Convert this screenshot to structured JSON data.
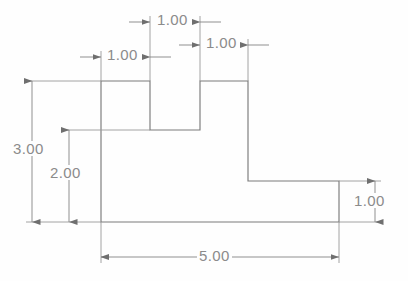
{
  "drawing": {
    "title": "Stepped profile dimensioned drawing",
    "units_per_px": 0.021,
    "colors": {
      "outline": "#7a7a7a",
      "dimension_line": "#8b8b8b",
      "text": "#8b8b8b",
      "background": "#fefefe"
    },
    "shape": {
      "name": "stepped-profile-outline",
      "points_px": "101,81 150,81 150,130 200,130 200,81 248,81 248,181 339,181 339,222 101,222",
      "vertices_units": [
        [
          0,
          3
        ],
        [
          1,
          3
        ],
        [
          1,
          2
        ],
        [
          2,
          2
        ],
        [
          2,
          3
        ],
        [
          3,
          3
        ],
        [
          3,
          1
        ],
        [
          4.909,
          1
        ],
        [
          4.909,
          0
        ],
        [
          0,
          0
        ]
      ]
    },
    "dimensions": [
      {
        "id": "top-notch-width",
        "label": "1.00",
        "value": 1.0,
        "orientation": "horizontal",
        "arrow_placement": "outside",
        "text_x": 150,
        "text_y": 14,
        "line_y": 22,
        "from_x": 150,
        "to_x": 200
      },
      {
        "id": "left-tab-width",
        "label": "1.00",
        "value": 1.0,
        "orientation": "horizontal",
        "arrow_placement": "outside",
        "text_x": 101,
        "text_y": 49,
        "line_y": 57,
        "from_x": 101,
        "to_x": 150
      },
      {
        "id": "right-tab-width",
        "label": "1.00",
        "value": 1.0,
        "orientation": "horizontal",
        "arrow_placement": "outside",
        "text_x": 200,
        "text_y": 37,
        "line_y": 45,
        "from_x": 200,
        "to_x": 248
      },
      {
        "id": "overall-height",
        "label": "3.00",
        "value": 3.0,
        "orientation": "vertical",
        "arrow_placement": "inside",
        "text_x": 14,
        "text_y": 142,
        "line_x": 32,
        "from_y": 81,
        "to_y": 222
      },
      {
        "id": "shoulder-height",
        "label": "2.00",
        "value": 2.0,
        "orientation": "vertical",
        "arrow_placement": "inside",
        "text_x": 50,
        "text_y": 166,
        "line_x": 69,
        "from_y": 130,
        "to_y": 222
      },
      {
        "id": "right-flange-height",
        "label": "1.00",
        "value": 1.0,
        "orientation": "vertical",
        "arrow_placement": "inside",
        "text_x": 352,
        "text_y": 194,
        "line_x": 375,
        "from_y": 181,
        "to_y": 222
      },
      {
        "id": "overall-width",
        "label": "5.00",
        "value": 5.0,
        "orientation": "horizontal",
        "arrow_placement": "inside",
        "text_x": 200,
        "text_y": 249,
        "line_y": 257,
        "from_x": 101,
        "to_x": 339
      }
    ]
  },
  "chart_data": {
    "type": "diagram",
    "subtype": "engineering-dimension-drawing",
    "outline_vertices_units": [
      [
        0,
        3
      ],
      [
        1,
        3
      ],
      [
        1,
        2
      ],
      [
        2,
        2
      ],
      [
        2,
        3
      ],
      [
        3,
        3
      ],
      [
        3,
        1
      ],
      [
        4.909,
        1
      ],
      [
        4.909,
        0
      ],
      [
        0,
        0
      ]
    ],
    "dimension_labels": [
      "1.00",
      "1.00",
      "1.00",
      "3.00",
      "2.00",
      "1.00",
      "5.00"
    ],
    "dimension_values": [
      1.0,
      1.0,
      1.0,
      3.0,
      2.0,
      1.0,
      5.0
    ],
    "xlabel": "",
    "ylabel": "",
    "grid": false,
    "legend": false
  }
}
